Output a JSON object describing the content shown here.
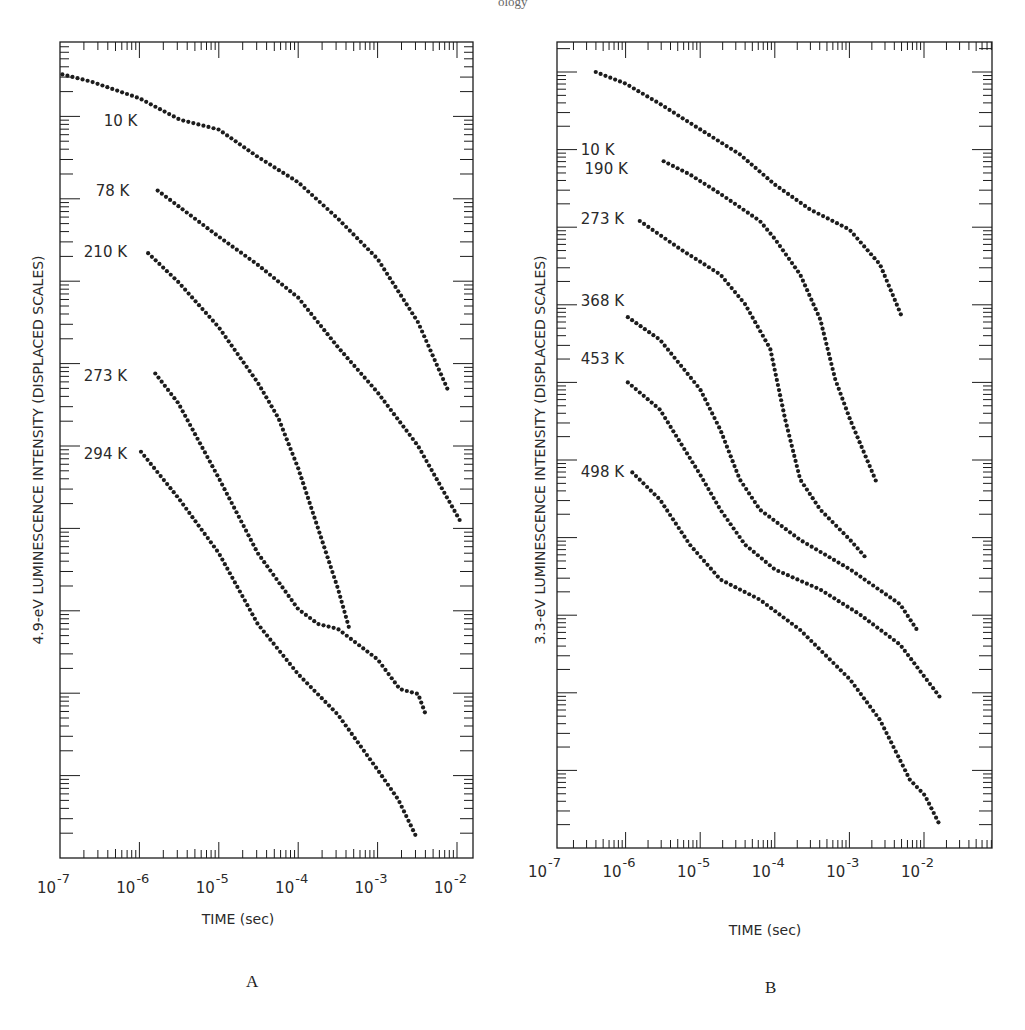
{
  "header_fragment": "ology",
  "chart_data": [
    {
      "id": "A",
      "type": "scatter",
      "panel_label": "A",
      "title": "",
      "xlabel": "TIME  (sec)",
      "ylabel": "4.9-eV  LUMINESCENCE  INTENSITY  (DISPLACED  SCALES)",
      "x_scale": "log",
      "y_scale": "log",
      "xlim_log10": [
        -7,
        -1.8
      ],
      "ylim_decades": [
        0,
        9.9
      ],
      "x_tick_labels": [
        {
          "base": "10",
          "exp": "-7",
          "log10": -7
        },
        {
          "base": "10",
          "exp": "-6",
          "log10": -6
        },
        {
          "base": "10",
          "exp": "-5",
          "log10": -5
        },
        {
          "base": "10",
          "exp": "-4",
          "log10": -4
        },
        {
          "base": "10",
          "exp": "-3",
          "log10": -3
        },
        {
          "base": "10",
          "exp": "-2",
          "log10": -2
        }
      ],
      "grid": false,
      "note": "x values are log10(time in sec); y values are log10 intensity in decades above the frame bottom (displaced scales, arbitrary offsets)",
      "series": [
        {
          "name": "10 K",
          "label_pos": [
            -6.45,
            8.95
          ],
          "x": [
            -6.97,
            -6.6,
            -6.3,
            -6.0,
            -5.49,
            -5.0,
            -4.51,
            -4.0,
            -3.5,
            -3.0,
            -2.49,
            -2.11
          ],
          "y": [
            9.51,
            9.42,
            9.32,
            9.22,
            8.96,
            8.84,
            8.51,
            8.2,
            7.76,
            7.27,
            6.5,
            5.67
          ]
        },
        {
          "name": "78 K",
          "label_pos": [
            -6.55,
            8.1
          ],
          "x": [
            -5.77,
            -5.0,
            -4.51,
            -4.0,
            -3.5,
            -3.0,
            -2.49,
            -1.96
          ],
          "y": [
            8.1,
            7.54,
            7.2,
            6.8,
            6.2,
            5.65,
            5.0,
            4.09
          ]
        },
        {
          "name": "210 K",
          "label_pos": [
            -6.7,
            7.35
          ],
          "x": [
            -5.89,
            -5.51,
            -5.0,
            -4.51,
            -4.25,
            -4.0,
            -3.75,
            -3.5,
            -3.35
          ],
          "y": [
            7.34,
            6.99,
            6.44,
            5.77,
            5.34,
            4.73,
            4.0,
            3.27,
            2.76
          ]
        },
        {
          "name": "273 K",
          "label_pos": [
            -6.7,
            5.85
          ],
          "x": [
            -5.8,
            -5.51,
            -5.0,
            -4.51,
            -4.0,
            -3.75,
            -3.5,
            -3.0,
            -2.72,
            -2.49,
            -2.39
          ],
          "y": [
            5.88,
            5.52,
            4.61,
            3.7,
            3.02,
            2.84,
            2.78,
            2.41,
            2.05,
            1.99,
            1.73
          ]
        },
        {
          "name": "294 K",
          "label_pos": [
            -6.7,
            4.9
          ],
          "x": [
            -5.98,
            -5.51,
            -5.0,
            -4.51,
            -4.0,
            -3.5,
            -3.0,
            -2.74,
            -2.52
          ],
          "y": [
            4.93,
            4.37,
            3.7,
            2.84,
            2.23,
            1.74,
            1.07,
            0.71,
            0.27
          ]
        }
      ]
    },
    {
      "id": "B",
      "type": "scatter",
      "panel_label": "B",
      "title": "",
      "xlabel": "TIME  (sec)",
      "ylabel": "3.3-eV  LUMINESCENCE  INTENSITY  (DISPLACED  SCALES)",
      "x_scale": "log",
      "y_scale": "log",
      "xlim_log10": [
        -6.92,
        -1.1
      ],
      "ylim_decades": [
        0,
        10.4
      ],
      "x_tick_labels": [
        {
          "base": "10",
          "exp": "-7",
          "log10": -7
        },
        {
          "base": "10",
          "exp": "-6",
          "log10": -6
        },
        {
          "base": "10",
          "exp": "-5",
          "log10": -5
        },
        {
          "base": "10",
          "exp": "-4",
          "log10": -4
        },
        {
          "base": "10",
          "exp": "-3",
          "log10": -3
        },
        {
          "base": "10",
          "exp": "-2",
          "log10": -2
        }
      ],
      "grid": false,
      "note": "x values are log10(time in sec); y values are log10 intensity in decades above the frame bottom (displaced scales, arbitrary offsets)",
      "series": [
        {
          "name": "10 K",
          "label_pos": [
            -6.6,
            9.0
          ],
          "x": [
            -6.4,
            -6.0,
            -5.54,
            -5.0,
            -4.47,
            -4.0,
            -3.53,
            -3.0,
            -2.59,
            -2.29
          ],
          "y": [
            10.0,
            9.85,
            9.59,
            9.26,
            8.94,
            8.55,
            8.23,
            7.97,
            7.52,
            6.83
          ]
        },
        {
          "name": "190 K",
          "label_pos": [
            -6.55,
            8.75
          ],
          "x": [
            -5.49,
            -5.14,
            -4.73,
            -4.2,
            -4.0,
            -3.66,
            -3.39,
            -3.19,
            -2.99,
            -2.64
          ],
          "y": [
            8.85,
            8.68,
            8.43,
            8.08,
            7.85,
            7.39,
            6.81,
            6.04,
            5.52,
            4.72
          ]
        },
        {
          "name": "273 K",
          "label_pos": [
            -6.6,
            8.1
          ],
          "x": [
            -5.81,
            -5.27,
            -4.73,
            -4.4,
            -4.06,
            -3.86,
            -3.66,
            -3.39,
            -2.99,
            -2.78
          ],
          "y": [
            8.08,
            7.72,
            7.39,
            7.01,
            6.43,
            5.52,
            4.75,
            4.36,
            3.97,
            3.74
          ]
        },
        {
          "name": "368 K",
          "label_pos": [
            -6.6,
            7.05
          ],
          "x": [
            -5.97,
            -5.54,
            -5.0,
            -4.73,
            -4.47,
            -4.2,
            -3.66,
            -2.99,
            -2.32,
            -2.08
          ],
          "y": [
            6.84,
            6.55,
            5.91,
            5.39,
            4.75,
            4.36,
            3.97,
            3.59,
            3.14,
            2.79
          ]
        },
        {
          "name": "453 K",
          "label_pos": [
            -6.6,
            6.3
          ],
          "x": [
            -5.97,
            -5.54,
            -5.0,
            -4.73,
            -4.4,
            -4.0,
            -3.39,
            -2.86,
            -2.32,
            -1.76
          ],
          "y": [
            6.0,
            5.65,
            4.81,
            4.36,
            3.91,
            3.59,
            3.33,
            3.01,
            2.62,
            1.91
          ]
        },
        {
          "name": "498 K",
          "label_pos": [
            -6.6,
            4.85
          ],
          "x": [
            -5.91,
            -5.54,
            -5.14,
            -4.73,
            -4.2,
            -3.66,
            -2.99,
            -2.59,
            -2.19,
            -1.99,
            -1.79
          ],
          "y": [
            4.84,
            4.49,
            3.91,
            3.46,
            3.2,
            2.81,
            2.17,
            1.65,
            0.88,
            0.68,
            0.3
          ]
        }
      ]
    }
  ],
  "layout": {
    "panels": [
      {
        "left": 60,
        "top": 42,
        "right": 473,
        "bottom": 858,
        "x0_px": 60,
        "x0_log": -7,
        "px_per_decade_x": 79.4,
        "px_per_decade_y": 82.4,
        "xlabel_pos": [
          238,
          924
        ],
        "ylabel_pos": [
          43,
          450
        ],
        "tick_label_y": 893,
        "letter_pos": [
          246,
          990
        ]
      },
      {
        "left": 557,
        "top": 42,
        "right": 992,
        "bottom": 848,
        "x0_px": 551,
        "x0_log": -7,
        "px_per_decade_x": 74.6,
        "px_per_decade_y": 77.6,
        "xlabel_pos": [
          765,
          935
        ],
        "ylabel_pos": [
          545,
          450
        ],
        "tick_label_y": 877,
        "letter_pos": [
          765,
          996
        ]
      }
    ]
  }
}
